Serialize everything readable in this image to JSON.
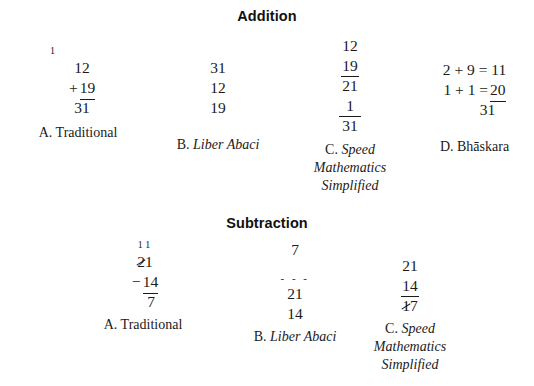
{
  "sections": [
    {
      "id": "addition",
      "heading": "Addition",
      "columns": [
        {
          "id": "addition-traditional",
          "caption_prefix": "A.",
          "caption_italic": "",
          "caption_plain": "Traditional",
          "caption_lines": [
            "A. Traditional"
          ],
          "carry": "1",
          "lines": [
            "12",
            "+ 19",
            "31"
          ]
        },
        {
          "id": "addition-liber-abaci",
          "caption_prefix": "B.",
          "caption_italic": "Liber Abaci",
          "caption_plain": "",
          "caption_lines": [
            "B. Liber Abaci"
          ],
          "carry": "",
          "lines": [
            "31",
            "12",
            "19"
          ]
        },
        {
          "id": "addition-speed-mathematics",
          "caption_prefix": "C.",
          "caption_italic": "Speed Mathematics Simplified",
          "caption_plain": "",
          "caption_lines": [
            "C. Speed",
            "Mathematics",
            "Simplified"
          ],
          "carry": "",
          "lines": [
            "12",
            "19",
            "21",
            "1",
            "31"
          ]
        },
        {
          "id": "addition-bhaskara",
          "caption_prefix": "D.",
          "caption_italic": "",
          "caption_plain": "Bhāskara",
          "caption_lines": [
            "D. Bhāskara"
          ],
          "carry": "",
          "lines": [
            "2 + 9 = 11",
            "1 + 1 = 20",
            "31"
          ]
        }
      ]
    },
    {
      "id": "subtraction",
      "heading": "Subtraction",
      "columns": [
        {
          "id": "subtraction-traditional",
          "caption_prefix": "A.",
          "caption_italic": "",
          "caption_plain": "Traditional",
          "caption_lines": [
            "A. Traditional"
          ],
          "carry": "1 1",
          "lines": [
            "21",
            "− 14",
            "7"
          ]
        },
        {
          "id": "subtraction-liber-abaci",
          "caption_prefix": "B.",
          "caption_italic": "Liber Abaci",
          "caption_plain": "",
          "caption_lines": [
            "B. Liber Abaci"
          ],
          "carry": "",
          "lines": [
            "7",
            "- - -",
            "21",
            "14"
          ]
        },
        {
          "id": "subtraction-speed-mathematics",
          "caption_prefix": "C.",
          "caption_italic": "Speed Mathematics Simplified",
          "caption_plain": "",
          "caption_lines": [
            "C. Speed",
            "Mathematics",
            "Simplified"
          ],
          "carry": "",
          "lines": [
            "21",
            "14",
            "17"
          ]
        }
      ]
    }
  ],
  "addition": {
    "heading": "Addition",
    "a": {
      "carry": "1",
      "operand1": "12",
      "plus": "+",
      "operand2": "19",
      "sum": "31",
      "caption": "A. Traditional",
      "caption_letter": "A.",
      "caption_text": "Traditional"
    },
    "b": {
      "line1": "31",
      "line2": "12",
      "line3": "19",
      "caption_letter": "B.",
      "caption_text": "Liber Abaci"
    },
    "c": {
      "line1": "12",
      "line2": "19",
      "line3": "21",
      "line4": "1",
      "line5": "31",
      "caption_letter": "C.",
      "caption_line1": "Speed",
      "caption_line2": "Mathematics",
      "caption_line3": "Simplified"
    },
    "d": {
      "line1": "2 + 9 = 11",
      "line2_prefix": "1 + 1 =",
      "line2_value": "20",
      "line3": "31",
      "caption_letter": "D.",
      "caption_text": "Bhāskara"
    }
  },
  "subtraction": {
    "heading": "Subtraction",
    "a": {
      "carry": "1 1",
      "minuend_struck": "2",
      "minuend_rest": "1",
      "minus": "−",
      "subtrahend": "14",
      "difference": "7",
      "caption_letter": "A.",
      "caption_text": "Traditional"
    },
    "b": {
      "line1": "7",
      "marks": "- - -",
      "line2": "21",
      "line3": "14",
      "caption_letter": "B.",
      "caption_text": "Liber Abaci"
    },
    "c": {
      "line1": "21",
      "line2": "14",
      "line3_struck": "1",
      "line3_rest": "7",
      "caption_letter": "C.",
      "caption_line1": "Speed",
      "caption_line2": "Mathematics",
      "caption_line3": "Simplified"
    }
  }
}
